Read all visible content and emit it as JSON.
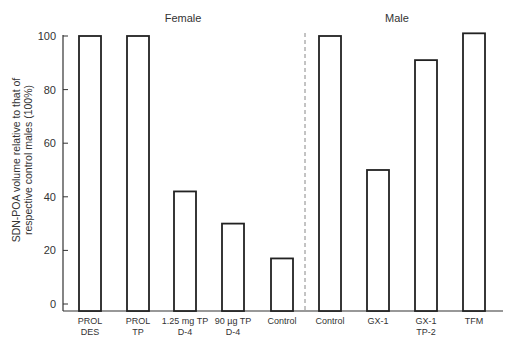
{
  "chart_data": {
    "type": "bar",
    "title": "",
    "xlabel": "",
    "ylabel": "SDN-POA volume relative to that of respective control males (100%)",
    "ylabel_lines": [
      "SDN-POA volume relative to that of",
      "respective control males (100%)"
    ],
    "ylim": [
      0,
      100
    ],
    "yticks": [
      0,
      20,
      40,
      60,
      80,
      100
    ],
    "grid": false,
    "legend": null,
    "bar_style": "outlined, white fill, black border",
    "groups": [
      {
        "name": "Female",
        "categories": [
          "PROL DES",
          "PROL TP",
          "1.25 mg TP D-4",
          "90 µg TP D-4",
          "Control"
        ]
      },
      {
        "name": "Male",
        "categories": [
          "Control",
          "GX-1",
          "GX-1 TP-2",
          "TFM"
        ]
      }
    ],
    "group_separator": "dashed vertical line between Female and Male",
    "categories": [
      "PROL DES",
      "PROL TP",
      "1.25 mg TP D-4",
      "90 µg TP D-4",
      "Control",
      "Control",
      "GX-1",
      "GX-1 TP-2",
      "TFM"
    ],
    "values": [
      100,
      100,
      42,
      30,
      17,
      100,
      50,
      91,
      101
    ]
  },
  "labels": {
    "female": "Female",
    "male": "Male",
    "ylabel_line1": "SDN-POA volume relative to that of",
    "ylabel_line2": "respective control males (100%)",
    "ticks": [
      "0",
      "20",
      "40",
      "60",
      "80",
      "100"
    ],
    "categories": [
      "PROL\nDES",
      "PROL\nTP",
      "1.25 mg TP\nD-4",
      "90 µg TP\nD-4",
      "Control",
      "Control",
      "GX-1",
      "GX-1\nTP-2",
      "TFM"
    ]
  }
}
